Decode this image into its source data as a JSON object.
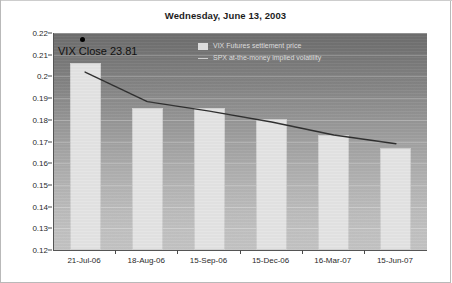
{
  "chart_data": {
    "type": "bar",
    "title": "Wednesday, June 13, 2003",
    "xlabel": "",
    "ylabel": "",
    "ylim": [
      0.12,
      0.22
    ],
    "ytick_step": 0.01,
    "yticks": [
      "0.22",
      "0.21",
      "0.2",
      "0.19",
      "0.18",
      "0.17",
      "0.16",
      "0.15",
      "0.14",
      "0.13",
      "0.12"
    ],
    "ytick_values": [
      0.22,
      0.21,
      0.2,
      0.19,
      0.18,
      0.17,
      0.16,
      0.15,
      0.14,
      0.13,
      0.12
    ],
    "categories": [
      "21-Jul-06",
      "18-Aug-06",
      "15-Sep-06",
      "15-Dec-06",
      "16-Mar-07",
      "15-Jun-07"
    ],
    "grid": true,
    "legend_position": "inside-top-center",
    "series": [
      {
        "name": "VIX Futures settlement price",
        "type": "bar",
        "color": "#e4e4e4",
        "values": [
          0.206,
          0.1854,
          0.1854,
          0.1804,
          0.1731,
          0.167
        ]
      },
      {
        "name": "SPX at-the-money implied volatility",
        "type": "line",
        "color": "#2e2e2e",
        "values": [
          0.202,
          0.1884,
          0.184,
          0.179,
          0.173,
          0.169
        ]
      }
    ],
    "annotations": [
      {
        "text": "VIX Close 23.81",
        "marker": "filled-circle",
        "marker_color": "#000000",
        "x_category": "21-Jul-06",
        "value": 0.2381
      }
    ]
  },
  "legend": {
    "items": [
      {
        "label": "VIX Futures settlement price",
        "swatch": "bar"
      },
      {
        "label": "SPX at-the-money implied volatility",
        "swatch": "line"
      }
    ]
  },
  "colors": {
    "bar_fill": "#e4e4e4",
    "line_stroke": "#2e2e2e",
    "plot_bg_top": "#6e6e6e",
    "plot_bg_bottom": "#c4c4c4",
    "axis": "#4a4a4a",
    "text": "#1c1c1c"
  }
}
